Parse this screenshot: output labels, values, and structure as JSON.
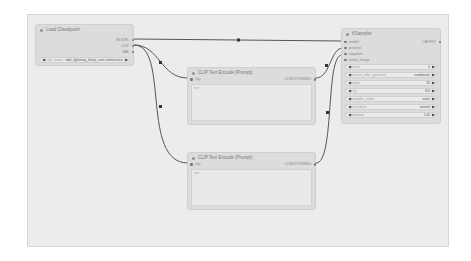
{
  "canvas": {
    "background": "#ececec",
    "link_color": "#555555"
  },
  "nodes": {
    "load_checkpoint": {
      "title": "Load Checkpoint",
      "outputs": [
        "MODEL",
        "CLIP",
        "VAE"
      ],
      "widgets": [
        {
          "label": "ckpt_name",
          "value": "sdxl_lightning_4step_unet.safetensors"
        }
      ]
    },
    "clip_positive": {
      "title": "CLIP Text Encode (Prompt)",
      "inputs": [
        "clip"
      ],
      "outputs": [
        "CONDITIONING"
      ],
      "text_placeholder": "text"
    },
    "clip_negative": {
      "title": "CLIP Text Encode (Prompt)",
      "inputs": [
        "clip"
      ],
      "outputs": [
        "CONDITIONING"
      ],
      "text_placeholder": "text"
    },
    "ksampler": {
      "title": "KSampler",
      "inputs": [
        "model",
        "positive",
        "negative",
        "latent_image"
      ],
      "outputs": [
        "LATENT"
      ],
      "widgets": [
        {
          "label": "seed",
          "value": "0"
        },
        {
          "label": "control_after_generate",
          "value": "randomize"
        },
        {
          "label": "steps",
          "value": "20"
        },
        {
          "label": "cfg",
          "value": "8.0"
        },
        {
          "label": "sampler_name",
          "value": "euler"
        },
        {
          "label": "scheduler",
          "value": "normal"
        },
        {
          "label": "denoise",
          "value": "1.00"
        }
      ]
    }
  },
  "icons": {
    "collapse_dot": "circle",
    "arrow_left": "◀",
    "arrow_right": "▶"
  }
}
